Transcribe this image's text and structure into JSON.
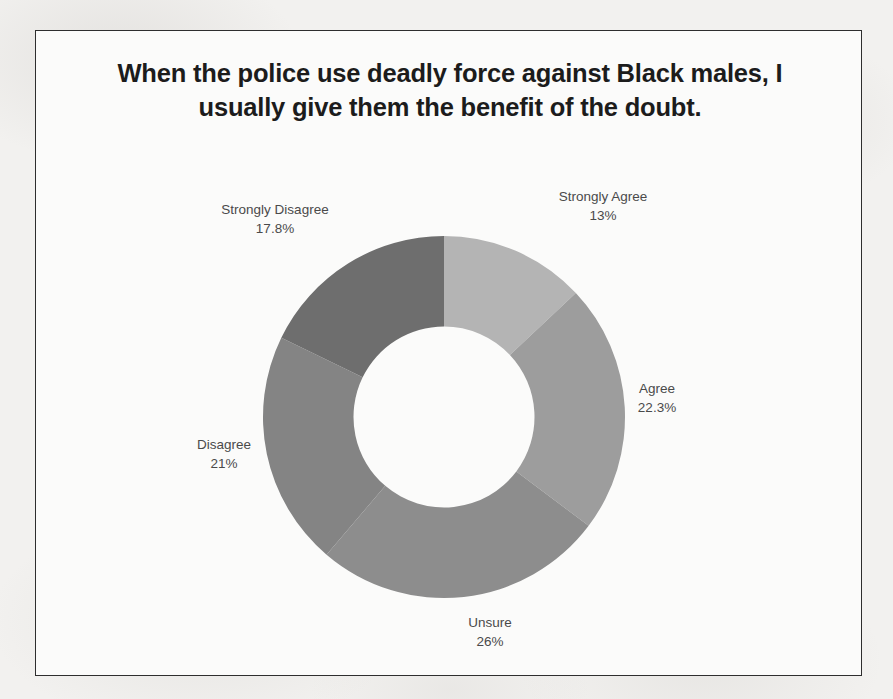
{
  "slide": {
    "title": "When the police use deadly force against Black males, I usually give them the benefit of the doubt."
  },
  "background": {
    "bleed_text": [
      "of the survey results and",
      "participants indicated that",
      "a majority of Black respondents"
    ]
  },
  "chart_data": {
    "type": "pie",
    "variant": "donut",
    "title": "When the police use deadly force against Black males, I usually give them the benefit of the doubt.",
    "categories": [
      "Strongly Agree",
      "Agree",
      "Unsure",
      "Disagree",
      "Strongly Disagree"
    ],
    "values": [
      13,
      22.3,
      26,
      21,
      17.8
    ],
    "value_labels": [
      "13%",
      "22.3%",
      "26%",
      "21%",
      "17.8%"
    ],
    "colors": [
      "#b4b4b4",
      "#9d9d9d",
      "#8d8d8d",
      "#848484",
      "#6e6e6e"
    ],
    "start_angle_deg": 0,
    "direction": "clockwise",
    "hole_ratio": 0.5,
    "legend": "none",
    "labels_position": "outside",
    "slices": [
      {
        "label": "Strongly Agree",
        "value": 13,
        "display": "13%",
        "color": "#b4b4b4"
      },
      {
        "label": "Agree",
        "value": 22.3,
        "display": "22.3%",
        "color": "#9d9d9d"
      },
      {
        "label": "Unsure",
        "value": 26,
        "display": "26%",
        "color": "#8d8d8d"
      },
      {
        "label": "Disagree",
        "value": 21,
        "display": "21%",
        "color": "#848484"
      },
      {
        "label": "Strongly Disagree",
        "value": 17.8,
        "display": "17.8%",
        "color": "#6e6e6e"
      }
    ]
  }
}
